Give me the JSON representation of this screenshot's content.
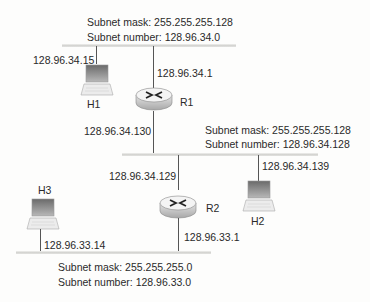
{
  "diagram": {
    "subnets": [
      {
        "id": "top",
        "mask_label": "Subnet mask: 255.255.255.128",
        "number_label": "Subnet number: 128.96.34.0"
      },
      {
        "id": "middle",
        "mask_label": "Subnet mask: 255.255.255.128",
        "number_label": "Subnet number: 128.96.34.128"
      },
      {
        "id": "bottom",
        "mask_label": "Subnet mask: 255.255.255.0",
        "number_label": "Subnet number: 128.96.33.0"
      }
    ],
    "hosts": [
      {
        "name": "H1",
        "ip": "128.96.34.15"
      },
      {
        "name": "H2",
        "ip": "128.96.34.139"
      },
      {
        "name": "H3",
        "ip": "128.96.33.14"
      }
    ],
    "routers": [
      {
        "name": "R1",
        "interfaces": [
          "128.96.34.1",
          "128.96.34.130"
        ]
      },
      {
        "name": "R2",
        "interfaces": [
          "128.96.34.129",
          "128.96.33.1"
        ]
      }
    ],
    "colors": {
      "line": "#555555",
      "bus": "#cfcfcc",
      "text": "#2a2a2a"
    }
  }
}
